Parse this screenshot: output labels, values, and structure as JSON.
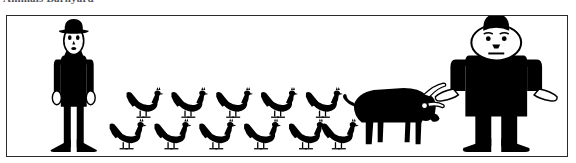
{
  "caption": {
    "text": "Animals Barnyard"
  },
  "figure": {
    "name": "barnyard-scene",
    "background_color": "#ffffff",
    "ink_color": "#000000",
    "frame_color": "#2b2b2b",
    "frame": {
      "x": 6,
      "y": 15,
      "width": 562,
      "height": 142,
      "border_px": 1.4
    },
    "subjects": [
      {
        "id": "tall-thin-man",
        "label": "Tall thin man with bowler hat",
        "count": 1,
        "position": {
          "x": 52,
          "y": 23,
          "width": 34,
          "height": 130
        },
        "details": {
          "hat": "bowler-hat",
          "face": "white oval face",
          "eyes": 2,
          "body": "black narrow suit",
          "hands": "white",
          "feet": "black splayed shoes"
        }
      },
      {
        "id": "chicken-flock",
        "label": "Chickens",
        "count": 11,
        "rows": [
          {
            "row": "top",
            "count": 5,
            "y": 88,
            "xs": [
              132,
              177,
              222,
              267,
              312
            ]
          },
          {
            "row": "bottom",
            "count": 6,
            "y": 120,
            "xs": [
              115,
              160,
              205,
              250,
              295,
              327
            ]
          }
        ],
        "details": {
          "body": "black",
          "tail": "raised",
          "comb": "small",
          "facing": "right"
        }
      },
      {
        "id": "bull",
        "label": "Black bull with white horns",
        "count": 1,
        "position": {
          "x": 352,
          "y": 98,
          "width": 86,
          "height": 55
        },
        "details": {
          "body": "black",
          "horns": "white",
          "eye": "white dot",
          "tail": "curled, left side",
          "legs": 4,
          "facing": "right"
        }
      },
      {
        "id": "short-fat-man",
        "label": "Short heavyset man with small hat",
        "count": 1,
        "position": {
          "x": 447,
          "y": 25,
          "width": 108,
          "height": 128
        },
        "details": {
          "hat": "small round black hat",
          "face": "white round face",
          "eyes": 2,
          "eyebrows": 2,
          "body": "black wide suit",
          "hands": "white",
          "feet": "black shoes"
        }
      }
    ]
  }
}
